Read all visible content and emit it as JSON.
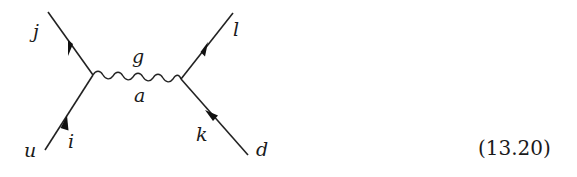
{
  "diagram": {
    "type": "feynman-diagram",
    "vertices": [
      {
        "id": "left",
        "x": 93,
        "y": 75
      },
      {
        "id": "right",
        "x": 181,
        "y": 79
      }
    ],
    "external_lines": [
      {
        "name": "u-i",
        "label_end": "u",
        "label_index": "i",
        "direction": "incoming"
      },
      {
        "name": "j",
        "label_end": "j",
        "direction": "outgoing"
      },
      {
        "name": "l",
        "label_end": "l",
        "direction": "outgoing"
      },
      {
        "name": "d-k",
        "label_end": "d",
        "label_index": "k",
        "direction": "incoming"
      }
    ],
    "propagator": {
      "type": "gluon-wavy",
      "label_top": "g",
      "label_bottom": "a"
    },
    "labels": {
      "j": "j",
      "u": "u",
      "i": "i",
      "l": "l",
      "d": "d",
      "k": "k",
      "g": "g",
      "a": "a"
    }
  },
  "equation_number": "(13.20)"
}
